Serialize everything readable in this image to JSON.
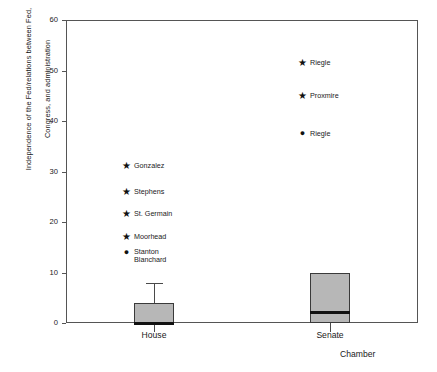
{
  "chart_data": {
    "type": "box",
    "title": "",
    "xlabel": "Chamber",
    "ylabel_lines": [
      "Independence of the Fed/relations between Fed,",
      "Congress, and administration"
    ],
    "ylabel": "Independence of the Fed/relations between Fed, Congress, and administration",
    "ylim": [
      0,
      60
    ],
    "yticks": [
      0,
      10,
      20,
      30,
      40,
      50,
      60
    ],
    "grid": false,
    "legend": "none",
    "categories": [
      "House",
      "Senate"
    ],
    "boxes": [
      {
        "category": "House",
        "q1": 0,
        "median": 0,
        "q3": 4,
        "whisker_low": 0,
        "whisker_high": 8,
        "outliers": [
          {
            "value": 31,
            "marker": "star",
            "label": "Gonzalez"
          },
          {
            "value": 26,
            "marker": "star",
            "label": "Stephens"
          },
          {
            "value": 21.5,
            "marker": "star",
            "label": "St. Germain"
          },
          {
            "value": 17,
            "marker": "star",
            "label": "Moorhead"
          },
          {
            "value": 14,
            "marker": "dot",
            "label": "Stanton\nBlanchard"
          }
        ]
      },
      {
        "category": "Senate",
        "q1": 0,
        "median": 2,
        "q3": 10,
        "whisker_low": 0,
        "whisker_high": 10,
        "outliers": [
          {
            "value": 51.5,
            "marker": "star",
            "label": "Riegle"
          },
          {
            "value": 45,
            "marker": "star",
            "label": "Proxmire"
          },
          {
            "value": 37.5,
            "marker": "dot",
            "label": "Riegle"
          }
        ]
      }
    ],
    "colors": {
      "box_fill": "#b7b7b7",
      "box_edge": "#3a3a3a",
      "median": "#111111",
      "whisker": "#4a4a4a",
      "axis": "#555555",
      "text": "#1a1a1a",
      "background": "#ffffff"
    },
    "marker_glyphs": {
      "star": "★",
      "dot": "●"
    }
  }
}
